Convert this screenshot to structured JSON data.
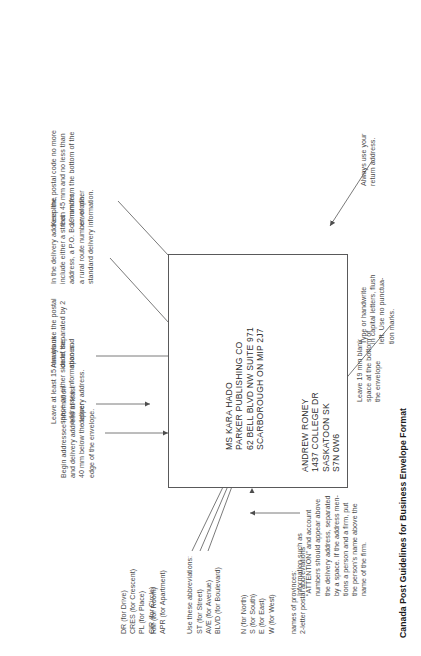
{
  "document": {
    "caption": "Canada Post Guidelines for Business Envelope Format",
    "orientation_degrees": -90
  },
  "envelope": {
    "return_address": {
      "label": "return-address-block",
      "lines": "ANDREW RONEY\n1437 COLLEGE DR\nSASKATOON SK\nS7N 0W6"
    },
    "delivery_address": {
      "label": "delivery-address-block",
      "lines": "MS KARA HADO\nPARKER PUBLISHING CO\n62 BELL BLVD NW SUITE 971\nSCARBOROUGH ON MIP 2J7"
    }
  },
  "annotations": {
    "begin_addressee": "Begin addressee information\nand delivery address at least\n40 mm below the upper\nedge of the envelope.",
    "delivery_address_line": "In the delivery address line,\ninclude either a street\naddress, a P.O. Box number,\na rural route number, or other\nstandard delivery information.",
    "blank_space_sides": "Leave at least 15 mm blank\nspace on either side of the\naddressee information and\ndelivery address.",
    "postal_code_spaces": "Always use the postal\ncode, separated by 2\nspaces.",
    "postal_code_position": "Keep the postal code no more\nthan 45 mm and no less than\n19 mm from the bottom of the\nenvelope.",
    "blank_space_bottom": "Leave 19 mm blank\nspace at the bottom of\nthe envelope",
    "capital_letters": "Type or handwrite\nin capital letters, flush\nleft. Use no punctua-\ntion marks.",
    "return_address_note": "Always use your\nreturn address.",
    "attention_note": "Information such as\n“ATTENTION” and account\nnumbers should appear above\nthe delivery address, separated\nby a space. If the address men-\ntions a person and a firm, put\nthe person’s name above the\nname of the firm."
  },
  "abbreviations": {
    "heading": "Use these abbreviations:",
    "column_1": "ST (for Street)\nAVE (for Avenue)\nBLVD (for Boulevard)",
    "column_2": "DR (for Drive)\nCRES (for Crescent)\nPL (for Place)\nCIR (for Circle)",
    "directions": "N (for North)\nS (for South)\nE (for East)\nW (for West)",
    "units": "RM (for Room)\nAPR (for Apartment)",
    "provinces": "names of provinces:\n2-letter postal abbreviations"
  },
  "colors": {
    "text": "#4a4a4a",
    "address_text": "#2e2e2e",
    "envelope_border": "#59595a",
    "leader_line": "#6b6b6b",
    "caption": "#1a1a1a"
  }
}
